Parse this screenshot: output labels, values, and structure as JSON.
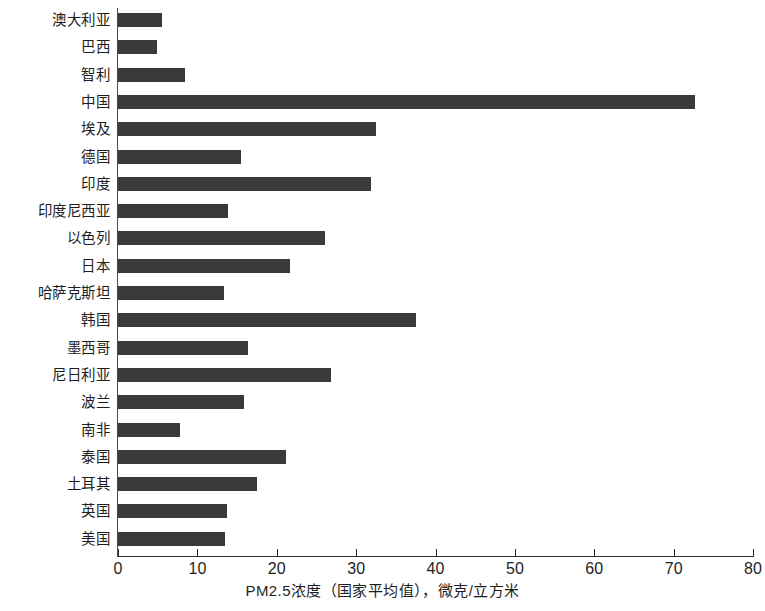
{
  "chart_data": {
    "type": "bar",
    "orientation": "horizontal",
    "title": "",
    "xlabel": "PM2.5浓度（国家平均值），微克/立方米",
    "ylabel": "",
    "xlim": [
      0,
      80
    ],
    "xticks": [
      0,
      10,
      20,
      30,
      40,
      50,
      60,
      70,
      80
    ],
    "xtick_labels": [
      "0",
      "10",
      "20",
      "30",
      "40",
      "50",
      "60",
      "70",
      "80"
    ],
    "grid": false,
    "legend": false,
    "bar_color": "#3a3a3a",
    "categories": [
      "澳大利亚",
      "巴西",
      "智利",
      "中国",
      "埃及",
      "德国",
      "印度",
      "印度尼西亚",
      "以色列",
      "日本",
      "哈萨克斯坦",
      "韩国",
      "墨西哥",
      "尼日利亚",
      "波兰",
      "南非",
      "泰国",
      "土耳其",
      "英国",
      "美国"
    ],
    "values": [
      5.5,
      4.9,
      8.4,
      72.7,
      32.5,
      15.5,
      31.9,
      13.9,
      26.1,
      21.7,
      13.4,
      37.6,
      16.4,
      26.8,
      15.9,
      7.8,
      21.2,
      17.5,
      13.7,
      13.5
    ]
  }
}
